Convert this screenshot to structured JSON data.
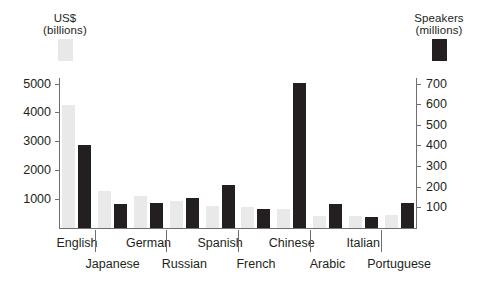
{
  "legend": {
    "left": {
      "line1": "US$",
      "line2": "(billions)",
      "swatch": "light-grey-bar-swatch",
      "color": "#e9e9e9"
    },
    "right": {
      "line1": "Speakers",
      "line2": "(millions)",
      "swatch": "black-bar-swatch",
      "color": "#231f20"
    }
  },
  "chart_data": {
    "type": "bar",
    "title": "",
    "xlabel": "",
    "grid": false,
    "legend_position": "top",
    "categories": [
      "English",
      "Japanese",
      "German",
      "Russian",
      "Spanish",
      "French",
      "Chinese",
      "Arabic",
      "Italian",
      "Portuguese"
    ],
    "series": [
      {
        "name": "US$ (billions)",
        "axis": "left",
        "color": "#e9e9e9",
        "values": [
          4250,
          1270,
          1100,
          930,
          760,
          720,
          650,
          420,
          420,
          450
        ]
      },
      {
        "name": "Speakers (millions)",
        "axis": "right",
        "color": "#231f20",
        "values": [
          400,
          115,
          120,
          145,
          210,
          90,
          705,
          115,
          55,
          120
        ]
      }
    ],
    "left_axis": {
      "label": "US$ (billions)",
      "ticks": [
        1000,
        2000,
        3000,
        4000,
        5000
      ],
      "tick_labels": [
        "1000",
        "2000",
        "3000",
        "4000",
        "5000"
      ],
      "ylim": [
        0,
        5400
      ]
    },
    "right_axis": {
      "label": "Speakers (millions)",
      "ticks": [
        100,
        200,
        300,
        400,
        500,
        600,
        700
      ],
      "tick_labels": [
        "100",
        "200",
        "300",
        "400",
        "500",
        "600",
        "700"
      ],
      "ylim": [
        0,
        756
      ]
    }
  }
}
